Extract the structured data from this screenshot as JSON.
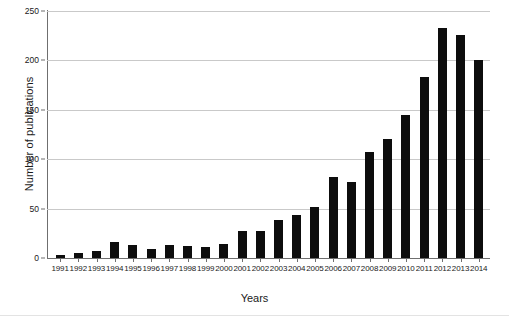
{
  "chart_data": {
    "type": "bar",
    "title": "",
    "xlabel": "Years",
    "ylabel": "Number of publications",
    "categories": [
      "1991",
      "1992",
      "1993",
      "1994",
      "1995",
      "1996",
      "1997",
      "1998",
      "1999",
      "2000",
      "2001",
      "2002",
      "2003",
      "2004",
      "2005",
      "2006",
      "2007",
      "2008",
      "2009",
      "2010",
      "2011",
      "2012",
      "2013",
      "2014"
    ],
    "values": [
      3,
      5,
      7,
      16,
      13,
      9,
      13,
      12,
      11,
      14,
      27,
      27,
      38,
      44,
      52,
      82,
      77,
      107,
      120,
      145,
      183,
      233,
      226,
      200
    ],
    "ylim": [
      0,
      250
    ],
    "yticks": [
      0,
      50,
      100,
      150,
      200,
      250
    ],
    "ytick_labels": [
      "0",
      "50",
      "100",
      "150",
      "200",
      "250"
    ],
    "grid": true,
    "legend": "none",
    "bar_color": "#0d0d0d",
    "gridline_color": "#c9c9c9",
    "axis_color": "#6f6f6f"
  }
}
